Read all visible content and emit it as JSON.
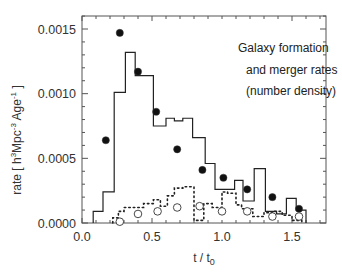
{
  "chart_data": {
    "type": "line",
    "title": "",
    "annotation": [
      "Galaxy formation",
      "and merger rates",
      "(number density)"
    ],
    "xlabel": "t / t0",
    "xlabel_main": "t / t",
    "xlabel_sub": "0",
    "ylabel": "rate [ h^3Mpc^-3 Age^-1 ]",
    "ylabel_parts": {
      "pre": "rate  [ h",
      "sup1": "3",
      "mid": "Mpc",
      "sup2": "-3",
      "mid2": " Age",
      "sup3": "-1",
      "post": " ]"
    },
    "xlim": [
      0.0,
      1.75
    ],
    "ylim": [
      0.0,
      0.0015
    ],
    "xticks": [
      0.0,
      0.5,
      1.0,
      1.5
    ],
    "xtick_labels": [
      "0.0",
      "0.5",
      "1.0",
      "1.5"
    ],
    "yticks": [
      0.0,
      0.0005,
      0.001,
      0.0015
    ],
    "ytick_labels": [
      "0.0000",
      "0.0005",
      "0.0010",
      "0.0015"
    ],
    "grid": false,
    "legend": null,
    "series": [
      {
        "name": "formation rate histogram (solid)",
        "style": "solid-step",
        "edges": [
          0.08,
          0.15,
          0.23,
          0.31,
          0.38,
          0.51,
          0.6,
          0.66,
          0.72,
          0.79,
          0.88,
          0.95,
          1.09,
          1.15,
          1.23,
          1.31,
          1.39,
          1.46,
          1.53,
          1.6
        ],
        "values": [
          9e-05,
          0.00024,
          0.00101,
          0.00132,
          0.00114,
          0.00075,
          0.00081,
          0.00079,
          0.00081,
          0.00066,
          0.00046,
          0.00026,
          0.00033,
          0.00017,
          0.00042,
          9e-05,
          7e-05,
          0.00019,
          0.0001
        ]
      },
      {
        "name": "merger rate histogram (dotted)",
        "style": "dotted-step",
        "edges": [
          0.22,
          0.26,
          0.3,
          0.36,
          0.44,
          0.51,
          0.56,
          0.61,
          0.66,
          0.72,
          0.8,
          0.8,
          0.87,
          0.93,
          1.0,
          1.04,
          1.1,
          1.14,
          1.22,
          1.3,
          1.36,
          1.43,
          1.5,
          1.57
        ],
        "values": [
          4e-05,
          9e-05,
          0.00012,
          0.00012,
          0.00015,
          0.00018,
          0.00013,
          0.00021,
          0.00027,
          0.00028,
          2e-05,
          2e-05,
          0.00015,
          0.00012,
          0.00024,
          0.00023,
          0.00014,
          0.00011,
          5e-05,
          8e-05,
          9e-05,
          6e-05,
          2e-05
        ]
      },
      {
        "name": "formation rate points (filled circles)",
        "style": "filled-circle",
        "x": [
          0.17,
          0.27,
          0.4,
          0.53,
          0.68,
          0.86,
          1.01,
          1.18,
          1.36,
          1.55
        ],
        "y": [
          0.00064,
          0.00147,
          0.00117,
          0.00086,
          0.00057,
          0.00041,
          0.00035,
          0.00026,
          0.0002,
          0.00011
        ]
      },
      {
        "name": "merger rate points (open circles)",
        "style": "open-circle",
        "x": [
          0.27,
          0.4,
          0.54,
          0.68,
          0.84,
          1.0,
          1.18,
          1.36,
          1.55
        ],
        "y": [
          1e-05,
          7e-05,
          9e-05,
          0.00012,
          0.00013,
          9e-05,
          9e-05,
          5e-05,
          5e-05
        ]
      }
    ]
  },
  "frame": {
    "left": 82,
    "right": 326,
    "top": 16,
    "bottom": 223
  },
  "colors": {
    "axis": "#555555",
    "line": "#222222",
    "text": "#333333",
    "background": "#ffffff"
  }
}
